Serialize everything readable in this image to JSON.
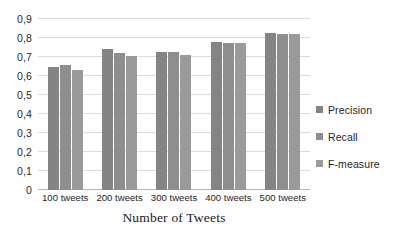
{
  "chart_data": {
    "type": "bar",
    "title": "",
    "xlabel": "Number of Tweets",
    "ylabel": "",
    "categories": [
      "100 tweets",
      "200 tweets",
      "300 tweets",
      "400 tweets",
      "500 tweets"
    ],
    "series": [
      {
        "name": "Precision",
        "color": "#848484",
        "values": [
          0.65,
          0.74,
          0.725,
          0.78,
          0.825
        ]
      },
      {
        "name": "Recall",
        "color": "#8e8e8e",
        "values": [
          0.66,
          0.72,
          0.725,
          0.775,
          0.82
        ]
      },
      {
        "name": "F-measure",
        "color": "#9a9a9a",
        "values": [
          0.63,
          0.705,
          0.71,
          0.773,
          0.82
        ]
      }
    ],
    "ylim": [
      0,
      0.9
    ],
    "ytick_step": 0.1,
    "ytick_labels": [
      "0",
      "0,1",
      "0,2",
      "0,3",
      "0,4",
      "0,5",
      "0,6",
      "0,7",
      "0,8",
      "0,9"
    ],
    "ytick_values": [
      0,
      0.1,
      0.2,
      0.3,
      0.4,
      0.5,
      0.6,
      0.7,
      0.8,
      0.9
    ],
    "decimal_separator": ",",
    "grid": true,
    "grid_axis": "y",
    "grid_color": "#dcdcdc",
    "legend_position": "right",
    "background_color": "#ffffff"
  }
}
